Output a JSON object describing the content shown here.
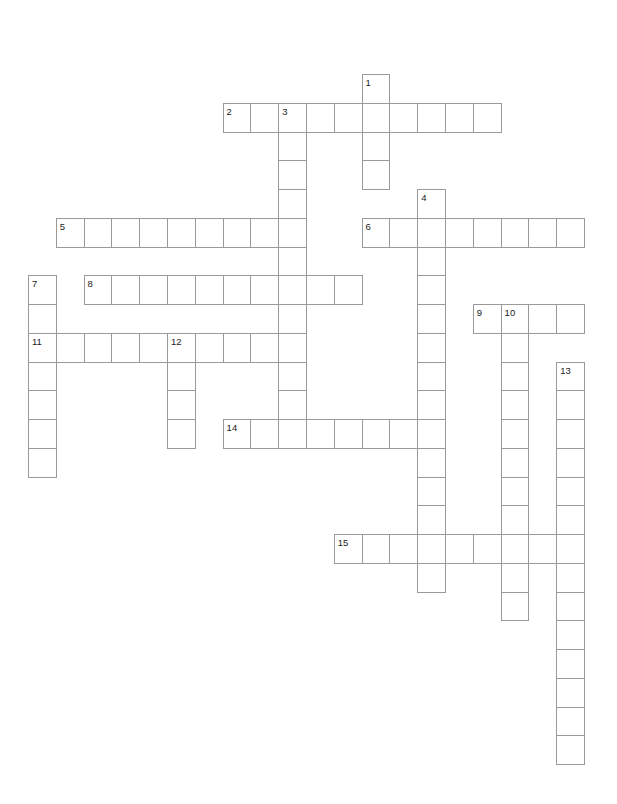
{
  "puzzle": {
    "grid": {
      "origin_x": 28,
      "origin_y": 74,
      "col_pitch": 27.8,
      "row_pitch": 28.75
    },
    "border_color": "#9a9a9a",
    "words": [
      {
        "number": "1",
        "direction": "down",
        "row": 0,
        "col": 12,
        "length": 4
      },
      {
        "number": "2",
        "direction": "across",
        "row": 1,
        "col": 7,
        "length": 10
      },
      {
        "number": "3",
        "direction": "down",
        "row": 1,
        "col": 9,
        "length": 12
      },
      {
        "number": "4",
        "direction": "down",
        "row": 4,
        "col": 14,
        "length": 14
      },
      {
        "number": "5",
        "direction": "across",
        "row": 5,
        "col": 1,
        "length": 9
      },
      {
        "number": "6",
        "direction": "across",
        "row": 5,
        "col": 12,
        "length": 8
      },
      {
        "number": "7",
        "direction": "down",
        "row": 7,
        "col": 0,
        "length": 7
      },
      {
        "number": "8",
        "direction": "across",
        "row": 7,
        "col": 2,
        "length": 10
      },
      {
        "number": "9",
        "direction": "across",
        "row": 8,
        "col": 16,
        "length": 4
      },
      {
        "number": "10",
        "direction": "down",
        "row": 8,
        "col": 17,
        "length": 11
      },
      {
        "number": "11",
        "direction": "across",
        "row": 9,
        "col": 0,
        "length": 10
      },
      {
        "number": "12",
        "direction": "down",
        "row": 9,
        "col": 5,
        "length": 4
      },
      {
        "number": "13",
        "direction": "down",
        "row": 10,
        "col": 19,
        "length": 14
      },
      {
        "number": "14",
        "direction": "across",
        "row": 12,
        "col": 7,
        "length": 8
      },
      {
        "number": "15",
        "direction": "across",
        "row": 16,
        "col": 11,
        "length": 9
      }
    ]
  }
}
